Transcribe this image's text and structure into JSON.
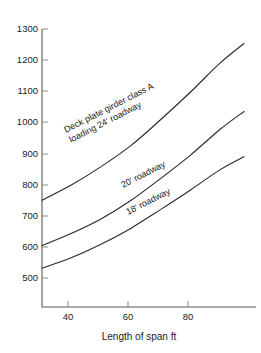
{
  "chart_data": {
    "type": "line",
    "title": "",
    "xlabel": "Length of span ft",
    "ylabel": "",
    "xlim": [
      30,
      98
    ],
    "ylim": [
      450,
      1310
    ],
    "grid": false,
    "legend": "inline-curve-labels",
    "x_ticks": [
      40,
      60,
      80
    ],
    "y_ticks": [
      500,
      600,
      700,
      800,
      900,
      1000,
      1100,
      1200,
      1300
    ],
    "x": [
      30,
      40,
      50,
      60,
      70,
      80,
      90,
      98
    ],
    "series": [
      {
        "name": "Deck plate girder class A loading 24' roadway",
        "label_line1": "Deck plate girder class A",
        "label_line2": "loading 24' roadway",
        "values": [
          780,
          828,
          885,
          950,
          1030,
          1115,
          1205,
          1265
        ]
      },
      {
        "name": "20' roadway",
        "label_line1": "20' roadway",
        "label_line2": "",
        "values": [
          640,
          678,
          723,
          780,
          848,
          920,
          1000,
          1055
        ]
      },
      {
        "name": "18' roadway",
        "label_line1": "18' roadway",
        "label_line2": "",
        "values": [
          570,
          603,
          645,
          694,
          752,
          812,
          875,
          915
        ]
      }
    ]
  },
  "axis": {
    "x_tick_40": "40",
    "x_tick_60": "60",
    "x_tick_80": "80",
    "y_tick_500": "500",
    "y_tick_600": "600",
    "y_tick_700": "700",
    "y_tick_800": "800",
    "y_tick_900": "900",
    "y_tick_1000": "1000",
    "y_tick_1100": "1100",
    "y_tick_1200": "1200",
    "y_tick_1300": "1300",
    "x_axis_title": "Length of span ft"
  },
  "annotations": {
    "curve1_line1": "Deck plate girder class A",
    "curve1_line2": "loading 24' roadway",
    "curve2_line1": "20' roadway",
    "curve3_line1": "18' roadway"
  },
  "colors": {
    "curve": "#2b2b2b",
    "axis": "#5a5a5a",
    "text": "#1a1a1a",
    "background": "#ffffff"
  }
}
